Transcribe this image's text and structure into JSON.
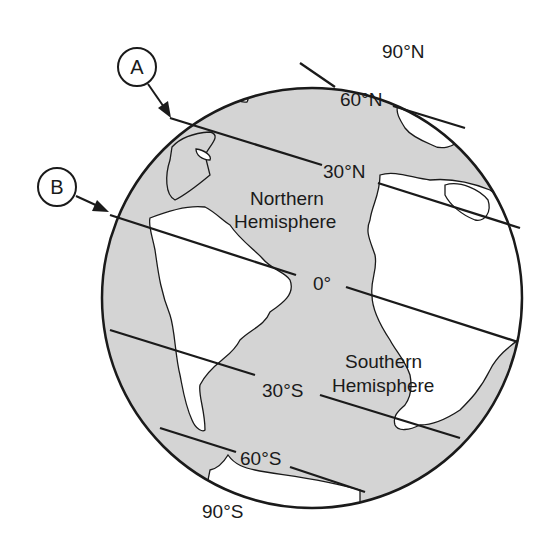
{
  "diagram": {
    "colors": {
      "ocean": "#d4d4d4",
      "land": "#ffffff",
      "line": "#1a1a1a"
    },
    "pole_labels": {
      "north": "90°N",
      "south": "90°S"
    },
    "latitude_labels": {
      "n60": "60°N",
      "n30": "30°N",
      "equator": "0°",
      "s30": "30°S",
      "s60": "60°S"
    },
    "hemisphere_labels": {
      "northern_line1": "Northern",
      "northern_line2": "Hemisphere",
      "southern_line1": "Southern",
      "southern_line2": "Hemisphere"
    },
    "callouts": [
      {
        "id": "A",
        "label": "A",
        "points_to": "30°N latitude line"
      },
      {
        "id": "B",
        "label": "B",
        "points_to": "Equator (0°)"
      }
    ]
  }
}
